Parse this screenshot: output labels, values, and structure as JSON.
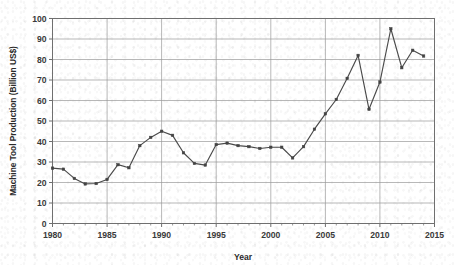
{
  "chart_data": {
    "type": "line",
    "title": "",
    "xlabel": "Year",
    "ylabel": "Machine Tool Production (Billion US$)",
    "xlim": [
      1980,
      2015
    ],
    "ylim": [
      0,
      100
    ],
    "xticks": [
      1980,
      1985,
      1990,
      1995,
      2000,
      2005,
      2010,
      2015
    ],
    "yticks": [
      0,
      10,
      20,
      30,
      40,
      50,
      60,
      70,
      80,
      90,
      100
    ],
    "grid": true,
    "legend": "none",
    "marker": "square",
    "series_color": "#4a4a4a",
    "x": [
      1980,
      1981,
      1982,
      1983,
      1984,
      1985,
      1986,
      1987,
      1988,
      1989,
      1990,
      1991,
      1992,
      1993,
      1994,
      1995,
      1996,
      1997,
      1998,
      1999,
      2000,
      2001,
      2002,
      2003,
      2004,
      2005,
      2006,
      2007,
      2008,
      2009,
      2010,
      2011,
      2012,
      2013,
      2014
    ],
    "values": [
      27,
      26.5,
      22,
      19.3,
      19.5,
      21.5,
      28.7,
      27.2,
      38,
      42,
      45,
      43,
      34.5,
      29.3,
      28.5,
      38.5,
      39.2,
      38,
      37.5,
      36.6,
      37.2,
      37.2,
      32,
      37.5,
      46,
      53.5,
      60.5,
      70.8,
      82,
      55.7,
      69,
      95,
      76,
      84.5,
      81.7
    ]
  },
  "axis": {
    "y_tick_labels": [
      "100",
      "90",
      "80",
      "70",
      "60",
      "50",
      "40",
      "30",
      "20",
      "10",
      "0"
    ],
    "x_tick_labels": [
      "1980",
      "1985",
      "1990",
      "1995",
      "2000",
      "2005",
      "2010",
      "2015"
    ]
  }
}
